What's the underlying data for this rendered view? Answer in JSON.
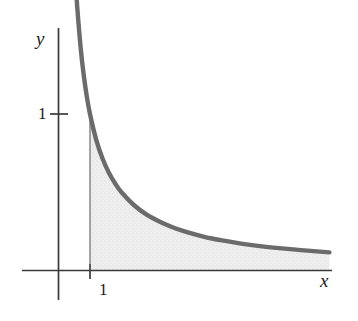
{
  "figure": {
    "background_color": "#ffffff",
    "width": 358,
    "height": 321,
    "axis_color": "#3a3a3a",
    "curve_color": "#6b6b6b",
    "shade_color": "#ececec",
    "text_color": "#1c1c1c"
  },
  "labels": {
    "y_axis": "y",
    "x_axis": "x",
    "y_tick_1": "1",
    "x_tick_1": "1"
  },
  "chart_data": {
    "type": "line",
    "title": "",
    "subtitle": "",
    "xlabel": "x",
    "ylabel": "y",
    "grid": false,
    "legend": [],
    "annotations": [],
    "axis_ticks": {
      "x": [
        "1"
      ],
      "y": [
        "1"
      ]
    },
    "xlim": [
      -0.6,
      9.0
    ],
    "ylim": [
      -0.2,
      2.6
    ],
    "series": [
      {
        "name": "y = 1/x",
        "type": "line",
        "x": [
          0.42,
          0.45,
          0.5,
          0.55,
          0.6,
          0.7,
          0.8,
          0.9,
          1.0,
          1.2,
          1.4,
          1.6,
          1.8,
          2.0,
          2.4,
          2.8,
          3.2,
          3.6,
          4.0,
          4.6,
          5.2,
          5.8,
          6.4,
          7.0,
          7.6,
          8.2,
          8.6
        ],
        "y": [
          2.38,
          2.22,
          2.0,
          1.82,
          1.67,
          1.43,
          1.25,
          1.11,
          1.0,
          0.833,
          0.714,
          0.625,
          0.556,
          0.5,
          0.417,
          0.357,
          0.313,
          0.278,
          0.25,
          0.217,
          0.192,
          0.172,
          0.156,
          0.143,
          0.132,
          0.122,
          0.116
        ]
      }
    ],
    "shaded_region": {
      "label": "area under y = 1/x for x >= 1",
      "x_start": 1.0,
      "x_end": 8.6,
      "upper_curve": "y = 1/x",
      "lower_curve": "y = 0"
    }
  }
}
